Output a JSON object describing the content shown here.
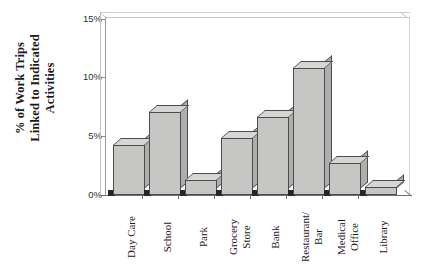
{
  "chart_data": {
    "type": "bar",
    "title": "",
    "subtitle": "",
    "xlabel": "",
    "ylabel": "% of Work Trips Linked to Indicated Activities",
    "ylabel_lines": [
      "% of Work Trips",
      "Linked to Indicated",
      "Activities"
    ],
    "categories": [
      "Day Care",
      "School",
      "Park",
      "Grocery Store",
      "Bank",
      "Restaurant/ Bar",
      "Medical Office",
      "Library"
    ],
    "category_lines": [
      [
        "Day Care"
      ],
      [
        "School"
      ],
      [
        "Park"
      ],
      [
        "Grocery",
        "Store"
      ],
      [
        "Bank"
      ],
      [
        "Restaurant/",
        "Bar"
      ],
      [
        "Medical",
        "Office"
      ],
      [
        "Library"
      ]
    ],
    "values": [
      4.2,
      7.0,
      1.3,
      4.8,
      6.6,
      10.7,
      2.7,
      0.7
    ],
    "value_unit": "%",
    "ylim": [
      0,
      15
    ],
    "ytick_values": [
      0,
      5,
      10,
      15
    ],
    "ytick_labels": [
      "0%",
      "5%",
      "10%",
      "15%"
    ],
    "grid": false,
    "legend": null,
    "style": "3d-bar",
    "bar_face_color": "#c6c6c4",
    "bar_side_color": "#aeaeac",
    "bar_top_color": "#d6d6d4",
    "bar_outline_color": "#4c4c4c",
    "shadow_color": "#262626",
    "axis_color": "#6e6e6e",
    "background_color": "#ffffff"
  }
}
